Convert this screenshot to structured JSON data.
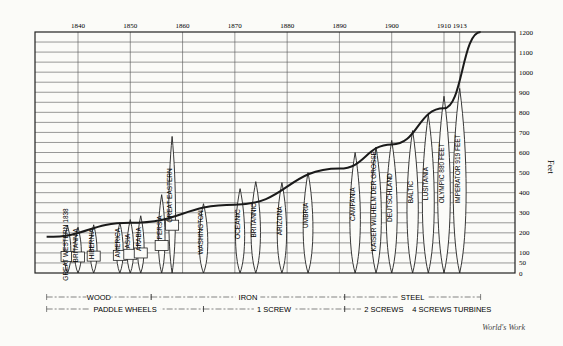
{
  "chart_data": {
    "type": "bar",
    "xlabel": "Year",
    "ylabel": "Feet",
    "ylim": [
      0,
      1200
    ],
    "grid": true,
    "x_ticks": [
      1840,
      1850,
      1860,
      1870,
      1880,
      1890,
      1900,
      1910,
      1913
    ],
    "y_ticks": [
      0,
      50,
      100,
      200,
      300,
      400,
      500,
      600,
      700,
      800,
      900,
      1000,
      1100,
      1200
    ],
    "y_tick_labels": [
      "0",
      "50",
      "100",
      "200",
      "300",
      "400",
      "500",
      "600",
      "700",
      "800",
      "900",
      "1000",
      "1100",
      "1200"
    ],
    "y_axis_title": "Feet",
    "ships": [
      {
        "name": "GREAT WESTERN 1838",
        "year": 1838,
        "length": 236,
        "kind": "paddle"
      },
      {
        "name": "BRITANNIA",
        "year": 1840,
        "length": 228,
        "kind": "paddle"
      },
      {
        "name": "HIBERNIA",
        "year": 1843,
        "length": 240,
        "kind": "paddle"
      },
      {
        "name": "AMERICA",
        "year": 1848,
        "length": 251,
        "kind": "paddle"
      },
      {
        "name": "ASIA",
        "year": 1850,
        "length": 266,
        "kind": "paddle"
      },
      {
        "name": "ARABIA",
        "year": 1852,
        "length": 285,
        "kind": "paddle"
      },
      {
        "name": "PERSIA",
        "year": 1856,
        "length": 390,
        "kind": "paddle"
      },
      {
        "name": "GREAT EASTERN",
        "year": 1858,
        "length": 680,
        "kind": "paddle"
      },
      {
        "name": "WASHINGTON",
        "year": 1864,
        "length": 345,
        "kind": "screw"
      },
      {
        "name": "OCEANIC",
        "year": 1871,
        "length": 420,
        "kind": "screw"
      },
      {
        "name": "BRITANNIC",
        "year": 1874,
        "length": 455,
        "kind": "screw"
      },
      {
        "name": "ARIZONA",
        "year": 1879,
        "length": 450,
        "kind": "screw"
      },
      {
        "name": "UMBRIA",
        "year": 1884,
        "length": 500,
        "kind": "screw"
      },
      {
        "name": "CAMPANIA",
        "year": 1893,
        "length": 600,
        "kind": "screw"
      },
      {
        "name": "KAISER WILHELM DER GROSSE",
        "year": 1897,
        "length": 627,
        "kind": "screw"
      },
      {
        "name": "DEUTSCHLAND",
        "year": 1900,
        "length": 660,
        "kind": "screw"
      },
      {
        "name": "BALTIC",
        "year": 1904,
        "length": 709,
        "kind": "screw"
      },
      {
        "name": "LUSITANIA",
        "year": 1907,
        "length": 787,
        "kind": "screw"
      },
      {
        "name": "OLYMPIC 880 FEET",
        "year": 1910,
        "length": 880,
        "kind": "screw"
      },
      {
        "name": "IMPERATOR 919 FEET",
        "year": 1913,
        "length": 919,
        "kind": "screw"
      }
    ],
    "trend_curve": {
      "description": "Exponential growth curve of ship length",
      "points": [
        [
          1834,
          180
        ],
        [
          1850,
          250
        ],
        [
          1870,
          340
        ],
        [
          1890,
          520
        ],
        [
          1900,
          640
        ],
        [
          1910,
          820
        ],
        [
          1917,
          1200
        ]
      ]
    },
    "annotations": {
      "material": [
        {
          "label": "WOOD",
          "from": 1834,
          "to": 1854
        },
        {
          "label": "IRON",
          "from": 1854,
          "to": 1891
        },
        {
          "label": "STEEL",
          "from": 1891,
          "to": 1917
        }
      ],
      "propulsion": [
        {
          "label": "PADDLE WHEELS",
          "from": 1834,
          "to": 1864
        },
        {
          "label": "1 SCREW",
          "from": 1864,
          "to": 1891
        },
        {
          "label": "2 SCREWS",
          "from": 1891,
          "to": 1906
        },
        {
          "label": "4 SCREWS TURBINES",
          "from": 1906,
          "to": 1917
        }
      ]
    },
    "credit": "World's Work"
  },
  "credit": "World's Work"
}
